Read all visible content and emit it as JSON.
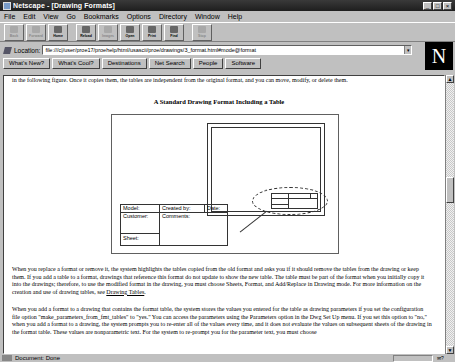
{
  "window": {
    "title": "Netscape - [Drawing Formats]",
    "controls": [
      "_",
      "□",
      "×"
    ]
  },
  "menubar": {
    "items": [
      "File",
      "Edit",
      "View",
      "Go",
      "Bookmarks",
      "Options",
      "Directory",
      "Window",
      "Help"
    ]
  },
  "toolbar": {
    "buttons": [
      {
        "label": "Back",
        "icon": "back-arrow-icon",
        "disabled": true
      },
      {
        "label": "Forward",
        "icon": "forward-arrow-icon",
        "disabled": true
      },
      {
        "label": "Home",
        "icon": "home-icon",
        "disabled": false
      },
      {
        "label": "Reload",
        "icon": "reload-icon",
        "disabled": false
      },
      {
        "label": "Images",
        "icon": "images-icon",
        "disabled": true
      },
      {
        "label": "Open",
        "icon": "open-icon",
        "disabled": false
      },
      {
        "label": "Print",
        "icon": "print-icon",
        "disabled": false
      },
      {
        "label": "Find",
        "icon": "find-icon",
        "disabled": false
      },
      {
        "label": "Stop",
        "icon": "stop-icon",
        "disabled": true
      }
    ]
  },
  "location": {
    "label": "Location:",
    "value": "file:///c|/user/proe17/proehelp/html/usascii/proe/drawings/3_format.html#mode@format"
  },
  "directory_buttons": [
    "What's New?",
    "What's Cool?",
    "Destinations",
    "Net Search",
    "People",
    "Software"
  ],
  "content": {
    "intro": "in the following figure. Once it copies them, the tables are independent from the original format, and you can move, modify, or delete them.",
    "figure_title": "A Standard Drawing Format Including a Table",
    "figure_table": {
      "model": "Model:",
      "created_by": "Created by:",
      "date": "Date:",
      "customer": "Customer:",
      "comments": "Comments:",
      "sheet": "Sheet:"
    },
    "para1": "When you replace a format or remove it, the system highlights the tables copied from the old format and asks you if it should remove the tables from the drawing or keep them. If you add a table to a format, drawings that reference this format do not update to show the new table. The table must be part of the format when you initially copy it into the drawings; therefore, to use the modified format in the drawing, you must choose Sheets, Format, and Add/Replace in Drawing mode. For more information on the creation and use of drawing tables, see ",
    "para1_link": "Drawing Tables",
    "para1_end": ".",
    "para2": "When you add a format to a drawing that contains the format table, the system stores the values you entered for the table as drawing parameters if you set the configuration file option \"make_parameters_from_fmt_tables\" to \"yes.\" You can access the parameters using the Parameters option in the Dwg Set Up menu. If you set this option to \"no,\" when you add a format to a drawing, the system prompts you to re-enter all of the values every time, and it does not evaluate the values on subsequent sheets of the drawing in the format table. These values are nonparametric text. For the system to re-prompt you for the parameter text, you must choose"
  },
  "statusbar": {
    "text": "Document: Done",
    "mail": "✉?"
  }
}
